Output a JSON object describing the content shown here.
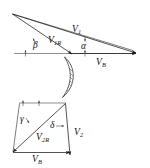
{
  "figure": {
    "background_color": "#ffffff",
    "line_color": "#1b1b1b",
    "baseline_color": "#8f8f8f",
    "width": 150,
    "height": 168,
    "upper_triangle": {
      "name": "inlet-velocity-triangle",
      "labels": {
        "absolute_velocity": "V",
        "absolute_velocity_sub": "1",
        "relative_velocity": "V",
        "relative_velocity_sub": "1R",
        "blade_velocity": "V",
        "blade_velocity_sub": "B",
        "relative_flow_angle": "β",
        "absolute_flow_angle": "α"
      }
    },
    "blade": {
      "name": "blade-profile",
      "hatched": true,
      "hatch_color": "#2a2a2a"
    },
    "lower_triangle": {
      "name": "outlet-velocity-triangle",
      "labels": {
        "absolute_velocity": "V",
        "absolute_velocity_sub": "2",
        "relative_velocity": "V",
        "relative_velocity_sub": "2R",
        "blade_velocity": "V",
        "blade_velocity_sub": "B",
        "relative_flow_angle": "γ",
        "absolute_flow_angle": "δ"
      }
    }
  }
}
